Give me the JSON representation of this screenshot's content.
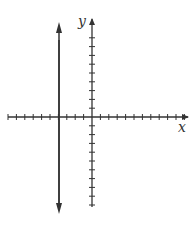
{
  "diagram": {
    "type": "coordinate-plane",
    "x_axis_label": "x",
    "y_axis_label": "y",
    "x_ticks_left_of_origin": 10,
    "x_ticks_right_of_origin": 11,
    "y_ticks_above_origin": 9,
    "y_ticks_below_origin": 10,
    "vertical_line": {
      "x": -4,
      "description": "double-arrowed vertical line at x = -4"
    },
    "color": "#333333"
  }
}
